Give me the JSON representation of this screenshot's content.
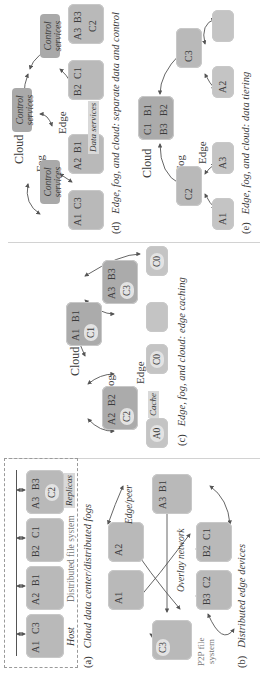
{
  "figure": {
    "panels": {
      "a": {
        "id": "(a)",
        "caption": "Cloud data center/distributed fogs",
        "bus_label": "Distributed file system",
        "host_label": "Host",
        "replicas_label": "Replicas",
        "hosts": [
          {
            "data": [
              "A1",
              "C3"
            ]
          },
          {
            "data": [
              "A2",
              "B1"
            ]
          },
          {
            "data": [
              "B2",
              "C1"
            ]
          },
          {
            "data": [
              "A3",
              "B3",
              "C2"
            ]
          }
        ]
      },
      "b": {
        "id": "(b)",
        "caption": "Distributed edge devices",
        "network_label": "Overlay network",
        "peer_label": "Edge/peer",
        "fs_label_1": "P2P file",
        "fs_label_2": "system",
        "nodes": [
          {
            "data": [
              "C3"
            ]
          },
          {
            "data": [
              "A1"
            ]
          },
          {
            "data": [
              "A2"
            ]
          },
          {
            "data": [
              "A3",
              "B1"
            ]
          },
          {
            "data": [
              "B2",
              "C1"
            ]
          },
          {
            "data": [
              "B3",
              "C2"
            ]
          }
        ]
      },
      "c": {
        "id": "(c)",
        "caption": "Edge, fog, and cloud: edge caching",
        "tiers": {
          "cloud": "Cloud",
          "fog": "Fog",
          "edge": "Edge"
        },
        "cache_label": "Cache",
        "cloud_node": [
          "A1",
          "B1",
          "C1"
        ],
        "fog_nodes": [
          [
            "A2",
            "B2",
            "C2"
          ],
          [
            "A3",
            "B3",
            "C3"
          ]
        ],
        "edge_nodes": [
          [
            "A0"
          ],
          [
            "C0"
          ],
          [],
          [
            "C0"
          ]
        ]
      },
      "d": {
        "id": "(d)",
        "caption": "Edge, fog, and cloud: separate data and control",
        "tiers": {
          "cloud": "Cloud",
          "fog": "Fog",
          "edge": "Edge"
        },
        "control_label_1": "Control",
        "control_label_2": "services",
        "data_services_label": "Data services",
        "edge_nodes": [
          [
            "A1",
            "C3"
          ],
          [
            "A2",
            "B1"
          ],
          [
            "B2",
            "C1"
          ],
          [
            "A3",
            "B3",
            "C2"
          ]
        ]
      },
      "e": {
        "id": "(e)",
        "caption": "Edge, fog, and cloud: data tiering",
        "tiers": {
          "cloud": "Cloud",
          "fog": "Fog",
          "edge": "Edge"
        },
        "cloud_node": [
          "C1",
          "B1",
          "B3",
          "B2"
        ],
        "fog_nodes": [
          [
            "C2"
          ],
          [
            "C3"
          ]
        ],
        "edge_nodes": [
          [
            "A1"
          ],
          [
            "A3"
          ],
          [
            "A2"
          ],
          []
        ]
      }
    },
    "colors": {
      "box": "#b9b9b9",
      "box_dark": "#ababab",
      "tag": "#d9d9d9",
      "circle": "#e3e3e3",
      "line": "#555555",
      "text": "#3a3a3a"
    }
  }
}
